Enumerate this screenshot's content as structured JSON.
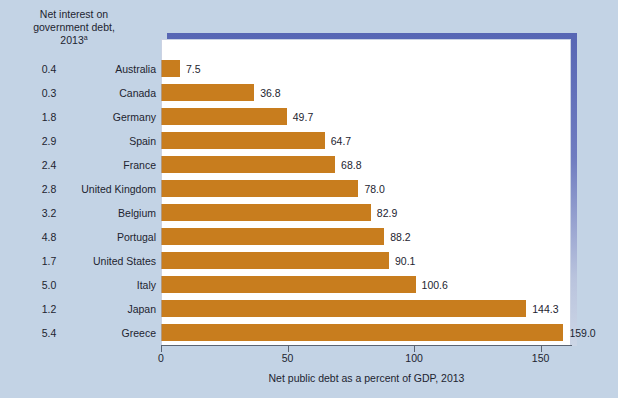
{
  "chart_data": {
    "type": "bar",
    "orientation": "horizontal",
    "title": "",
    "xlabel": "Net public debt as a percent of GDP, 2013",
    "ylabel": "",
    "xlim": [
      0,
      162
    ],
    "xticks": [
      0,
      50,
      100,
      150
    ],
    "xtick_labels": [
      "0",
      "50",
      "100",
      "150"
    ],
    "grid": false,
    "legend": null,
    "categories": [
      "Australia",
      "Canada",
      "Germany",
      "Spain",
      "France",
      "United Kingdom",
      "Belgium",
      "Portugal",
      "United States",
      "Italy",
      "Japan",
      "Greece"
    ],
    "values": [
      7.5,
      36.8,
      49.7,
      64.7,
      68.8,
      78.0,
      82.9,
      88.2,
      90.1,
      100.6,
      144.3,
      159.0
    ],
    "value_labels": [
      "7.5",
      "36.8",
      "49.7",
      "64.7",
      "68.8",
      "78.0",
      "82.9",
      "88.2",
      "90.1",
      "100.6",
      "144.3",
      "159.0"
    ],
    "series": [
      {
        "name": "Net public debt as a percent of GDP, 2013",
        "values": [
          7.5,
          36.8,
          49.7,
          64.7,
          68.8,
          78.0,
          82.9,
          88.2,
          90.1,
          100.6,
          144.3,
          159.0
        ],
        "color": "#c87d1e"
      },
      {
        "name": "Net interest on government debt, 2013",
        "values": [
          0.4,
          0.3,
          1.8,
          2.9,
          2.4,
          2.8,
          3.2,
          4.8,
          1.7,
          5.0,
          1.2,
          5.4
        ],
        "labels": [
          "0.4",
          "0.3",
          "1.8",
          "2.9",
          "2.4",
          "2.8",
          "3.2",
          "4.8",
          "1.7",
          "5.0",
          "1.2",
          "5.4"
        ],
        "render": "text-column"
      }
    ]
  },
  "left_column": {
    "header_line1": "Net interest on",
    "header_line2": "government debt,",
    "header_line3": "2013",
    "header_footnote": "a"
  },
  "rows": [
    {
      "interest": "0.4",
      "country": "Australia",
      "value": 7.5,
      "label": "7.5"
    },
    {
      "interest": "0.3",
      "country": "Canada",
      "value": 36.8,
      "label": "36.8"
    },
    {
      "interest": "1.8",
      "country": "Germany",
      "value": 49.7,
      "label": "49.7"
    },
    {
      "interest": "2.9",
      "country": "Spain",
      "value": 64.7,
      "label": "64.7"
    },
    {
      "interest": "2.4",
      "country": "France",
      "value": 68.8,
      "label": "68.8"
    },
    {
      "interest": "2.8",
      "country": "United Kingdom",
      "value": 78.0,
      "label": "78.0"
    },
    {
      "interest": "3.2",
      "country": "Belgium",
      "value": 82.9,
      "label": "82.9"
    },
    {
      "interest": "4.8",
      "country": "Portugal",
      "value": 88.2,
      "label": "88.2"
    },
    {
      "interest": "1.7",
      "country": "United States",
      "value": 90.1,
      "label": "90.1"
    },
    {
      "interest": "5.0",
      "country": "Italy",
      "value": 100.6,
      "label": "100.6"
    },
    {
      "interest": "1.2",
      "country": "Japan",
      "value": 144.3,
      "label": "144.3"
    },
    {
      "interest": "5.4",
      "country": "Greece",
      "value": 159.0,
      "label": "159.0"
    }
  ],
  "axis": {
    "ticks": [
      "0",
      "50",
      "100",
      "150"
    ],
    "tick_values": [
      0,
      50,
      100,
      150
    ],
    "title": "Net public debt as a percent of GDP, 2013"
  },
  "colors": {
    "background": "#c3d3e5",
    "bar": "#c87d1e",
    "panel": "#ffffff",
    "frame": "#5766b4",
    "text": "#1d2430"
  }
}
